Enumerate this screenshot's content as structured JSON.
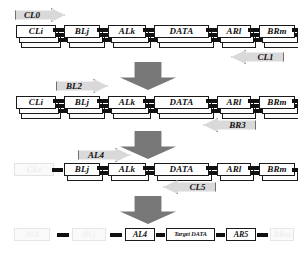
{
  "diagram": {
    "colors": {
      "box_fill": "#ffffff",
      "box_border": "#1a1a1a",
      "connector": "#111111",
      "side_arrow_fill": "#d9d9d9",
      "side_arrow_border": "#6f6f6f",
      "down_arrow_fill": "#787878",
      "ghost": "#ededed"
    },
    "rows": [
      {
        "id": "row-1",
        "boxes": [
          {
            "label": "CLi",
            "ghost": false
          },
          {
            "label": "BLj",
            "ghost": false
          },
          {
            "label": "ALk",
            "ghost": false
          },
          {
            "label": "DATA",
            "ghost": false
          },
          {
            "label": "ARl",
            "ghost": false
          },
          {
            "label": "BRm",
            "ghost": false
          },
          {
            "label": "CRn",
            "ghost": false
          }
        ],
        "arrows": [
          {
            "label": "CL0",
            "direction": "right"
          },
          {
            "label": "CL1",
            "direction": "left"
          }
        ]
      },
      {
        "id": "row-2",
        "boxes": [
          {
            "label": "CLi",
            "ghost": false
          },
          {
            "label": "BLj",
            "ghost": false
          },
          {
            "label": "ALk",
            "ghost": false
          },
          {
            "label": "DATA",
            "ghost": false
          },
          {
            "label": "ARl",
            "ghost": false
          },
          {
            "label": "BRm",
            "ghost": false
          },
          {
            "label": "CRn",
            "ghost": false
          }
        ],
        "arrows": [
          {
            "label": "BL2",
            "direction": "right"
          },
          {
            "label": "BR3",
            "direction": "left"
          }
        ]
      },
      {
        "id": "row-3",
        "boxes": [
          {
            "label": "CLi",
            "ghost": true
          },
          {
            "label": "BLj",
            "ghost": false
          },
          {
            "label": "ALk",
            "ghost": false
          },
          {
            "label": "DATA",
            "ghost": false
          },
          {
            "label": "ARl",
            "ghost": false
          },
          {
            "label": "BRm",
            "ghost": false
          },
          {
            "label": "CRn",
            "ghost": true
          }
        ],
        "arrows": [
          {
            "label": "AL4",
            "direction": "right"
          },
          {
            "label": "CL5",
            "direction": "left"
          }
        ]
      }
    ],
    "final_row": {
      "id": "row-4",
      "boxes": [
        {
          "label": "ALk",
          "ghost": true
        },
        {
          "label": "BLj",
          "ghost": true
        },
        {
          "label": "AL4",
          "ghost": false
        },
        {
          "label": "Target DATA",
          "ghost": false
        },
        {
          "label": "AR5",
          "ghost": false
        },
        {
          "label": "BRm",
          "ghost": true
        },
        {
          "label": "CRn",
          "ghost": true
        }
      ]
    },
    "down_arrows": [
      {
        "id": "down-arrow-1"
      },
      {
        "id": "down-arrow-2"
      },
      {
        "id": "down-arrow-3"
      }
    ]
  }
}
